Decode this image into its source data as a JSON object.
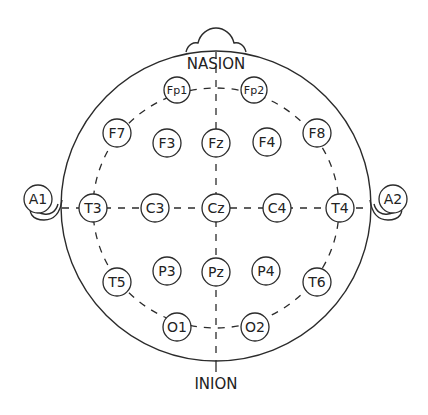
{
  "diagram": {
    "colors": {
      "stroke": "#2b2b2b",
      "text": "#222222",
      "background": "#ffffff"
    },
    "landmarks": {
      "nasion": "NASION",
      "inion": "INION"
    },
    "electrodes": {
      "fp1": "Fp1",
      "fp2": "Fp2",
      "f7": "F7",
      "f3": "F3",
      "fz": "Fz",
      "f4": "F4",
      "f8": "F8",
      "a1": "A1",
      "t3": "T3",
      "c3": "C3",
      "cz": "Cz",
      "c4": "C4",
      "t4": "T4",
      "a2": "A2",
      "t5": "T5",
      "p3": "P3",
      "pz": "Pz",
      "p4": "P4",
      "t6": "T6",
      "o1": "O1",
      "o2": "O2"
    }
  }
}
